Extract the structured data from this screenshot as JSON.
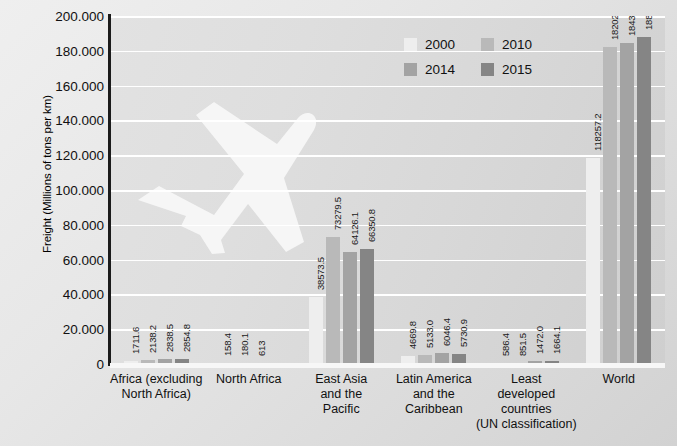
{
  "chart_data": {
    "type": "bar",
    "title": "",
    "xlabel": "",
    "ylabel": "Freight (Millions of tons per km)",
    "ylim": [
      0,
      200000
    ],
    "ytick_labels": [
      "200.000",
      "180.000",
      "160.000",
      "140.000",
      "120.000",
      "100.000",
      "80.000",
      "60.000",
      "40.000",
      "20.000",
      "0"
    ],
    "ytick_values": [
      200000,
      180000,
      160000,
      140000,
      120000,
      100000,
      80000,
      60000,
      40000,
      20000,
      0
    ],
    "grid": true,
    "legend_position": "top-right-inside",
    "categories": [
      "Africa (excluding\nNorth Africa)",
      "North Africa",
      "East Asia\nand the\nPacific",
      "Latin America\nand the\nCaribbean",
      "Least\ndeveloped\ncountries\n(UN classification)",
      "World"
    ],
    "series": [
      {
        "name": "2000",
        "color": "#eeeeee",
        "values": [
          1711.6,
          158.4,
          38573.5,
          4669.8,
          586.4,
          118257.2
        ],
        "labels": [
          "1711.6",
          "158.4",
          "38573.5",
          "4669.8",
          "586.4",
          "118257.2"
        ]
      },
      {
        "name": "2010",
        "color": "#b9b9b9",
        "values": [
          2138.2,
          180.1,
          73279.5,
          5133.0,
          851.5,
          182025.6
        ],
        "labels": [
          "2138.2",
          "180.1",
          "73279.5",
          "5133.0",
          "851.5",
          "182025.6"
        ]
      },
      {
        "name": "2014",
        "color": "#a3a3a3",
        "values": [
          2838.5,
          613,
          64126.1,
          6046.4,
          1472.0,
          184315.2
        ],
        "labels": [
          "2838.5",
          "613",
          "64126.1",
          "6046.4",
          "1472.0",
          "184315.2"
        ]
      },
      {
        "name": "2015",
        "color": "#858585",
        "values": [
          2854.8,
          0,
          66350.8,
          5730.9,
          1664.1,
          188000.2
        ],
        "labels": [
          "2854.8",
          "",
          "66350.8",
          "5730.9",
          "1664.1",
          "188000.2"
        ]
      }
    ],
    "watermark": "airplane-silhouette"
  }
}
